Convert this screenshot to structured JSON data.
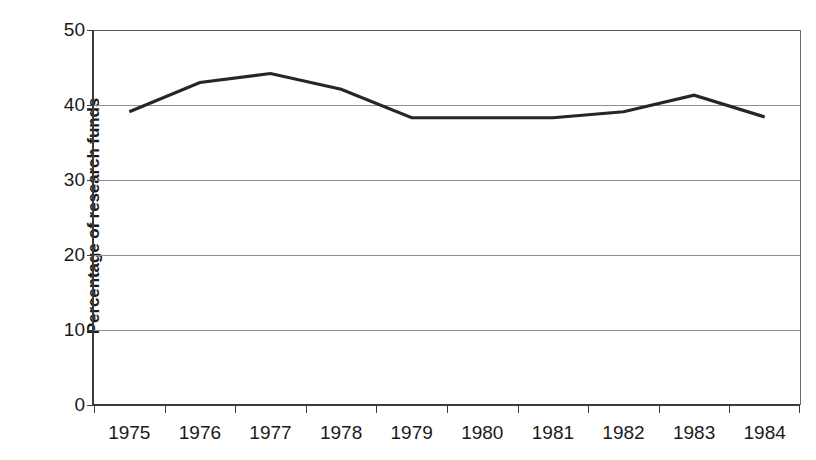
{
  "chart_data": {
    "type": "line",
    "title": "",
    "subtitle": "",
    "xlabel": "",
    "ylabel": "Percentage of research funds",
    "categories": [
      "1975",
      "1976",
      "1977",
      "1978",
      "1979",
      "1980",
      "1981",
      "1982",
      "1983",
      "1984"
    ],
    "series": [
      {
        "name": "Percentage of research funds",
        "values": [
          39.1,
          43.0,
          44.2,
          42.1,
          38.3,
          38.3,
          38.3,
          39.1,
          41.3,
          38.4
        ],
        "color": "#262626"
      }
    ],
    "ylim": [
      0,
      50
    ],
    "yticks": [
      0,
      10,
      20,
      30,
      40,
      50
    ],
    "ytick_labels": [
      "0",
      "10",
      "20",
      "30",
      "40",
      "50"
    ],
    "grid": true,
    "grid_axis": "y",
    "grid_color": "#8f8f8f",
    "legend": false,
    "legend_position": "none",
    "axis_color": "#3a3a3a",
    "background": "#ffffff"
  },
  "axes": {
    "y_title": "Percentage of research funds",
    "y_tick_labels": [
      "50",
      "40",
      "30",
      "20",
      "10",
      "0"
    ],
    "x_tick_labels": [
      "1975",
      "1976",
      "1977",
      "1978",
      "1979",
      "1980",
      "1981",
      "1982",
      "1983",
      "1984"
    ]
  }
}
